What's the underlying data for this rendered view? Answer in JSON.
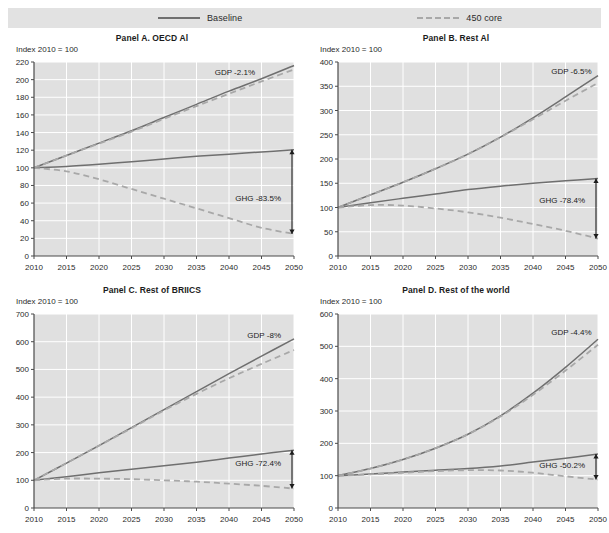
{
  "legend": {
    "items": [
      {
        "label": "Baseline",
        "style": "solid",
        "color": "#6f6f6f"
      },
      {
        "label": "450 core",
        "style": "dashed",
        "color": "#a8a8a8"
      }
    ]
  },
  "axis_note": "Index 2010 = 100",
  "colors": {
    "plot_background": "#e0e0e0",
    "gridline": "#ffffff",
    "baseline_line": "#6f6f6f",
    "core_line": "#a8a8a8",
    "axis": "#4a4a4a",
    "text": "#222222",
    "legend_background": "#e2e2e2"
  },
  "chart_data": [
    {
      "type": "line",
      "panel_id": "A",
      "title": "Panel A. OECD Al",
      "ylabel": "Index 2010 = 100",
      "xlabel": "",
      "ylim": [
        0,
        220
      ],
      "yticks": [
        0,
        20,
        40,
        60,
        80,
        100,
        120,
        140,
        160,
        180,
        200,
        220
      ],
      "xlim": [
        2010,
        2050
      ],
      "xticks": [
        2010,
        2015,
        2020,
        2025,
        2030,
        2035,
        2040,
        2045,
        2050
      ],
      "x": [
        2010,
        2015,
        2020,
        2025,
        2030,
        2035,
        2040,
        2045,
        2050
      ],
      "series": [
        {
          "name": "GDP Baseline",
          "style": "solid",
          "values": [
            100,
            114,
            128,
            142,
            157,
            172,
            187,
            201,
            216
          ]
        },
        {
          "name": "GDP 450 core",
          "style": "dashed",
          "values": [
            100,
            114,
            127.5,
            141,
            155.5,
            170,
            184,
            198,
            211.5
          ]
        },
        {
          "name": "GHG Baseline",
          "style": "solid",
          "values": [
            100,
            101.5,
            104,
            107,
            110,
            113,
            115.5,
            118,
            120.5
          ]
        },
        {
          "name": "GHG 450 core",
          "style": "dashed",
          "values": [
            100,
            96,
            87,
            76,
            65,
            54,
            43,
            32,
            25
          ]
        }
      ],
      "annotations": [
        {
          "name": "gdp-gap",
          "label": "GDP -2.1%",
          "x": 2044,
          "y": 205
        },
        {
          "name": "ghg-gap",
          "label": "GHG -83.5%",
          "x": 2048,
          "y": 62
        }
      ],
      "gap_arrow": {
        "x": 2050,
        "y_top": 120.5,
        "y_bottom": 25
      },
      "grid": true,
      "legend_position": "top"
    },
    {
      "type": "line",
      "panel_id": "B",
      "title": "Panel B. Rest Al",
      "ylabel": "Index 2010 = 100",
      "xlabel": "",
      "ylim": [
        0,
        400
      ],
      "yticks": [
        0,
        50,
        100,
        150,
        200,
        250,
        300,
        350,
        400
      ],
      "xlim": [
        2010,
        2050
      ],
      "xticks": [
        2010,
        2015,
        2020,
        2025,
        2030,
        2035,
        2040,
        2045,
        2050
      ],
      "x": [
        2010,
        2015,
        2020,
        2025,
        2030,
        2035,
        2040,
        2045,
        2050
      ],
      "series": [
        {
          "name": "GDP Baseline",
          "style": "solid",
          "values": [
            100,
            126,
            152,
            180,
            210,
            245,
            285,
            328,
            372
          ]
        },
        {
          "name": "GDP 450 core",
          "style": "dashed",
          "values": [
            100,
            126,
            152,
            180,
            210,
            245,
            282,
            320,
            357
          ]
        },
        {
          "name": "GHG Baseline",
          "style": "solid",
          "values": [
            100,
            110,
            119,
            128,
            137,
            144,
            150,
            155,
            160
          ]
        },
        {
          "name": "GHG 450 core",
          "style": "dashed",
          "values": [
            100,
            105,
            104,
            98,
            90,
            79,
            66,
            52,
            36
          ]
        }
      ],
      "annotations": [
        {
          "name": "gdp-gap",
          "label": "GDP -6.5%",
          "x": 2049,
          "y": 375
        },
        {
          "name": "ghg-gap",
          "label": "GHG -78.4%",
          "x": 2048,
          "y": 110
        }
      ],
      "gap_arrow": {
        "x": 2050,
        "y_top": 160,
        "y_bottom": 36
      },
      "grid": true,
      "legend_position": "top"
    },
    {
      "type": "line",
      "panel_id": "C",
      "title": "Panel C. Rest of BRIICS",
      "ylabel": "Index 2010 = 100",
      "xlabel": "",
      "ylim": [
        0,
        700
      ],
      "yticks": [
        0,
        100,
        200,
        300,
        400,
        500,
        600,
        700
      ],
      "xlim": [
        2010,
        2050
      ],
      "xticks": [
        2010,
        2015,
        2020,
        2025,
        2030,
        2035,
        2040,
        2045,
        2050
      ],
      "x": [
        2010,
        2015,
        2020,
        2025,
        2030,
        2035,
        2040,
        2045,
        2050
      ],
      "series": [
        {
          "name": "GDP Baseline",
          "style": "solid",
          "values": [
            100,
            162,
            225,
            290,
            355,
            420,
            485,
            548,
            610
          ]
        },
        {
          "name": "GDP 450 core",
          "style": "dashed",
          "values": [
            100,
            162,
            225,
            288,
            352,
            412,
            468,
            520,
            570
          ]
        },
        {
          "name": "GHG Baseline",
          "style": "solid",
          "values": [
            100,
            113,
            127,
            140,
            152,
            165,
            180,
            195,
            208
          ]
        },
        {
          "name": "GHG 450 core",
          "style": "dashed",
          "values": [
            100,
            106,
            106,
            104,
            100,
            95,
            88,
            80,
            70
          ]
        }
      ],
      "annotations": [
        {
          "name": "gdp-gap",
          "label": "GDP -8%",
          "x": 2048,
          "y": 615
        },
        {
          "name": "ghg-gap",
          "label": "GHG -72.4%",
          "x": 2048,
          "y": 150
        }
      ],
      "gap_arrow": {
        "x": 2050,
        "y_top": 208,
        "y_bottom": 70
      },
      "grid": true,
      "legend_position": "top"
    },
    {
      "type": "line",
      "panel_id": "D",
      "title": "Panel D. Rest of the world",
      "ylabel": "Index 2010 = 100",
      "xlabel": "",
      "ylim": [
        0,
        600
      ],
      "yticks": [
        0,
        100,
        200,
        300,
        400,
        500,
        600
      ],
      "xlim": [
        2010,
        2050
      ],
      "xticks": [
        2010,
        2015,
        2020,
        2025,
        2030,
        2035,
        2040,
        2045,
        2050
      ],
      "x": [
        2010,
        2015,
        2020,
        2025,
        2030,
        2035,
        2040,
        2045,
        2050
      ],
      "series": [
        {
          "name": "GDP Baseline",
          "style": "solid",
          "values": [
            100,
            122,
            150,
            185,
            228,
            285,
            355,
            435,
            522
          ]
        },
        {
          "name": "GDP 450 core",
          "style": "dashed",
          "values": [
            100,
            122,
            150,
            185,
            228,
            283,
            350,
            425,
            505
          ]
        },
        {
          "name": "GHG Baseline",
          "style": "solid",
          "values": [
            100,
            105,
            111,
            117,
            122,
            130,
            142,
            154,
            167
          ]
        },
        {
          "name": "GHG 450 core",
          "style": "dashed",
          "values": [
            100,
            104,
            109,
            114,
            117,
            116,
            109,
            98,
            88
          ]
        }
      ],
      "annotations": [
        {
          "name": "gdp-gap",
          "label": "GDP -4.4%",
          "x": 2049,
          "y": 535
        },
        {
          "name": "ghg-gap",
          "label": "GHG -50.2%",
          "x": 2048,
          "y": 125
        }
      ],
      "gap_arrow": {
        "x": 2050,
        "y_top": 167,
        "y_bottom": 88
      },
      "grid": true,
      "legend_position": "top"
    }
  ]
}
